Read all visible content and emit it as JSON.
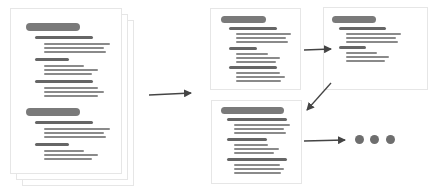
{
  "diagram": {
    "colors": {
      "heading_pill": "#7a7a7a",
      "subheading": "#666666",
      "body_line": "#8a8a8a",
      "border": "#e6e6e6",
      "arrow": "#444444",
      "dots": "#6e6e6e"
    },
    "nodes": [
      {
        "id": "source-document-stack",
        "type": "stacked-document",
        "pages": 3,
        "sections": 2
      },
      {
        "id": "chunk-1",
        "type": "document-card",
        "sections": 1
      },
      {
        "id": "chunk-2",
        "type": "document-card",
        "sections": 1
      },
      {
        "id": "chunk-3",
        "type": "document-card",
        "sections": 1
      },
      {
        "id": "continuation",
        "type": "ellipsis-dots",
        "count": 3
      }
    ],
    "edges": [
      {
        "from": "source-document-stack",
        "to": "chunk-1"
      },
      {
        "from": "chunk-1",
        "to": "chunk-2"
      },
      {
        "from": "chunk-2",
        "to": "chunk-3"
      },
      {
        "from": "chunk-3",
        "to": "continuation"
      }
    ]
  }
}
